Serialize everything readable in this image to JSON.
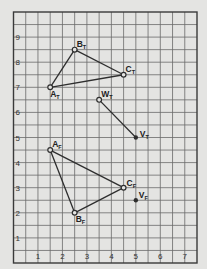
{
  "chart_data": {
    "type": "scatter",
    "title": "",
    "xlabel": "",
    "ylabel": "",
    "xlim": [
      0,
      7.5
    ],
    "ylim": [
      0,
      10
    ],
    "grid": true,
    "grid_minor_step": 0.5,
    "x_ticks": [
      1,
      2,
      3,
      4,
      5,
      6,
      7
    ],
    "y_ticks": [
      1,
      2,
      3,
      4,
      5,
      6,
      7,
      8,
      9
    ],
    "legend": null,
    "points": [
      {
        "name": "A",
        "sub": "T",
        "x": 1.5,
        "y": 7.0,
        "style": "hollow",
        "label_dx": 0,
        "label_dy": 10
      },
      {
        "name": "B",
        "sub": "T",
        "x": 2.5,
        "y": 8.5,
        "style": "hollow",
        "label_dx": 2,
        "label_dy": -3
      },
      {
        "name": "C",
        "sub": "T",
        "x": 4.5,
        "y": 7.5,
        "style": "hollow",
        "label_dx": 2,
        "label_dy": -3
      },
      {
        "name": "W",
        "sub": "T",
        "x": 3.5,
        "y": 6.5,
        "style": "hollow",
        "label_dx": 2,
        "label_dy": -3
      },
      {
        "name": "V",
        "sub": "T",
        "x": 5.0,
        "y": 5.0,
        "style": "filled",
        "label_dx": 4,
        "label_dy": -1
      },
      {
        "name": "A",
        "sub": "F",
        "x": 1.5,
        "y": 4.5,
        "style": "hollow",
        "label_dx": 2,
        "label_dy": -3
      },
      {
        "name": "B",
        "sub": "F",
        "x": 2.5,
        "y": 2.0,
        "style": "hollow",
        "label_dx": 1,
        "label_dy": 9
      },
      {
        "name": "C",
        "sub": "F",
        "x": 4.5,
        "y": 3.0,
        "style": "hollow",
        "label_dx": 3,
        "label_dy": -2
      },
      {
        "name": "V",
        "sub": "F",
        "x": 5.0,
        "y": 2.5,
        "style": "filled",
        "label_dx": 3,
        "label_dy": -2
      }
    ],
    "segments": [
      {
        "from": "A_T",
        "to": "B_T"
      },
      {
        "from": "B_T",
        "to": "C_T"
      },
      {
        "from": "C_T",
        "to": "A_T"
      },
      {
        "from": "W_T",
        "to": "V_T"
      },
      {
        "from": "A_F",
        "to": "B_F"
      },
      {
        "from": "B_F",
        "to": "C_F"
      },
      {
        "from": "C_F",
        "to": "A_F"
      }
    ],
    "shapes": [
      {
        "name": "Triangle T",
        "vertices": [
          "A_T",
          "B_T",
          "C_T"
        ]
      },
      {
        "name": "Segment W_T V_T",
        "vertices": [
          "W_T",
          "V_T"
        ]
      },
      {
        "name": "Triangle F",
        "vertices": [
          "A_F",
          "B_F",
          "C_F"
        ]
      },
      {
        "name": "Point V_F",
        "vertices": [
          "V_F"
        ]
      }
    ]
  },
  "colors": {
    "background": "#e4e4e2",
    "grid": "#6a6a6a",
    "ink": "#2e2e2e"
  }
}
